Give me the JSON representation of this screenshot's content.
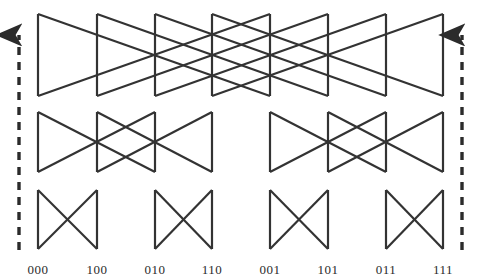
{
  "figure": {
    "kind": "butterfly-network-diagram",
    "title": "",
    "width": 483,
    "height": 279,
    "background_color": "#ffffff",
    "line_color": "#333333",
    "line_width": 2.2,
    "arrow_color": "#2b2b2b"
  },
  "chart_data": {
    "type": "diagram",
    "title": "",
    "subtitle": "",
    "xlabel": "",
    "ylabel": "",
    "node_count": 8,
    "stage_count": 3,
    "node_x": [
      38,
      97,
      155,
      212,
      270,
      328,
      386,
      443
    ],
    "labels": [
      "000",
      "100",
      "010",
      "110",
      "001",
      "101",
      "011",
      "111"
    ],
    "label_y": 262,
    "stages": [
      {
        "name": "stage-1",
        "stride": 4,
        "y_top": 14,
        "y_bottom": 96,
        "groups": [
          [
            0,
            1,
            2,
            3,
            4,
            5,
            6,
            7
          ]
        ],
        "verticals": [
          0,
          1,
          2,
          3,
          4,
          5,
          6,
          7
        ],
        "crossings": [
          [
            0,
            4
          ],
          [
            1,
            5
          ],
          [
            2,
            6
          ],
          [
            3,
            7
          ]
        ]
      },
      {
        "name": "stage-2",
        "stride": 2,
        "y_top": 112,
        "y_bottom": 172,
        "groups": [
          [
            0,
            1,
            2,
            3
          ],
          [
            4,
            5,
            6,
            7
          ]
        ],
        "verticals": [
          0,
          1,
          2,
          3,
          4,
          5,
          6,
          7
        ],
        "crossings": [
          [
            0,
            2
          ],
          [
            1,
            3
          ],
          [
            4,
            6
          ],
          [
            5,
            7
          ]
        ]
      },
      {
        "name": "stage-3",
        "stride": 1,
        "y_top": 190,
        "y_bottom": 249,
        "groups": [
          [
            0,
            1
          ],
          [
            2,
            3
          ],
          [
            4,
            5
          ],
          [
            6,
            7
          ]
        ],
        "verticals": [
          0,
          1,
          2,
          3,
          4,
          5,
          6,
          7
        ],
        "crossings": [
          [
            0,
            1
          ],
          [
            2,
            3
          ],
          [
            4,
            5
          ],
          [
            6,
            7
          ]
        ]
      }
    ],
    "flow_arrows": [
      {
        "name": "left-flow-arrow",
        "x": 19,
        "y_tail": 250,
        "y_head": 35,
        "direction": "up",
        "style": "dashed"
      },
      {
        "name": "right-flow-arrow",
        "x": 462,
        "y_tail": 250,
        "y_head": 35,
        "direction": "up",
        "style": "dashed"
      }
    ],
    "grid": false,
    "legend": null,
    "annotations": []
  }
}
